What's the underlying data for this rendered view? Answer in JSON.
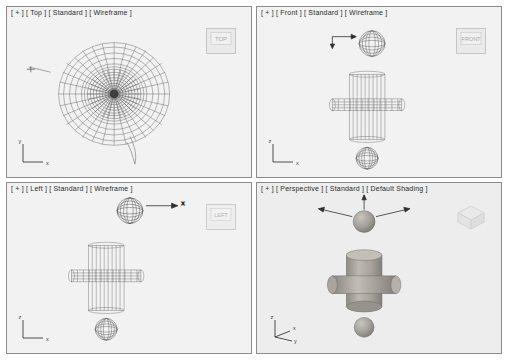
{
  "app": {
    "title": "3D modeling application viewport layout",
    "background_color": "#ffffff",
    "viewport_fill": "#f2f2f2",
    "viewport_border": "#8c8c8c",
    "wire_color": "#6e6e6e",
    "shaded_color": "#a8a49c"
  },
  "viewports": [
    {
      "id": "top",
      "label": "[ + ] [ Top ] [ Standard ] [ Wireframe ]",
      "label_parts": [
        "+",
        "Top",
        "Standard",
        "Wireframe"
      ],
      "viewcube_label": "TOP",
      "axis": {
        "x_label": "x",
        "y_label": "y",
        "z_label": ""
      }
    },
    {
      "id": "front",
      "label": "[ + ] [ Front ] [ Standard ] [ Wireframe ]",
      "label_parts": [
        "+",
        "Front",
        "Standard",
        "Wireframe"
      ],
      "viewcube_label": "FRONT",
      "axis": {
        "x_label": "x",
        "y_label": "",
        "z_label": "z"
      }
    },
    {
      "id": "left",
      "label": "[ + ] [ Left ] [ Standard ] [ Wireframe ]",
      "label_parts": [
        "+",
        "Left",
        "Standard",
        "Wireframe"
      ],
      "viewcube_label": "LEFT",
      "axis": {
        "x_label": "x",
        "y_label": "",
        "z_label": "z"
      }
    },
    {
      "id": "perspective",
      "label": "[ + ] [ Perspective ] [ Standard ] [ Default Shading ]",
      "label_parts": [
        "+",
        "Perspective",
        "Standard",
        "Default Shading"
      ],
      "viewcube_label": "",
      "axis": {
        "x_label": "x",
        "y_label": "y",
        "z_label": "z"
      }
    }
  ],
  "gizmo": {
    "x_axis_label": "x",
    "y_axis_label": "y",
    "z_axis_label": "z"
  }
}
